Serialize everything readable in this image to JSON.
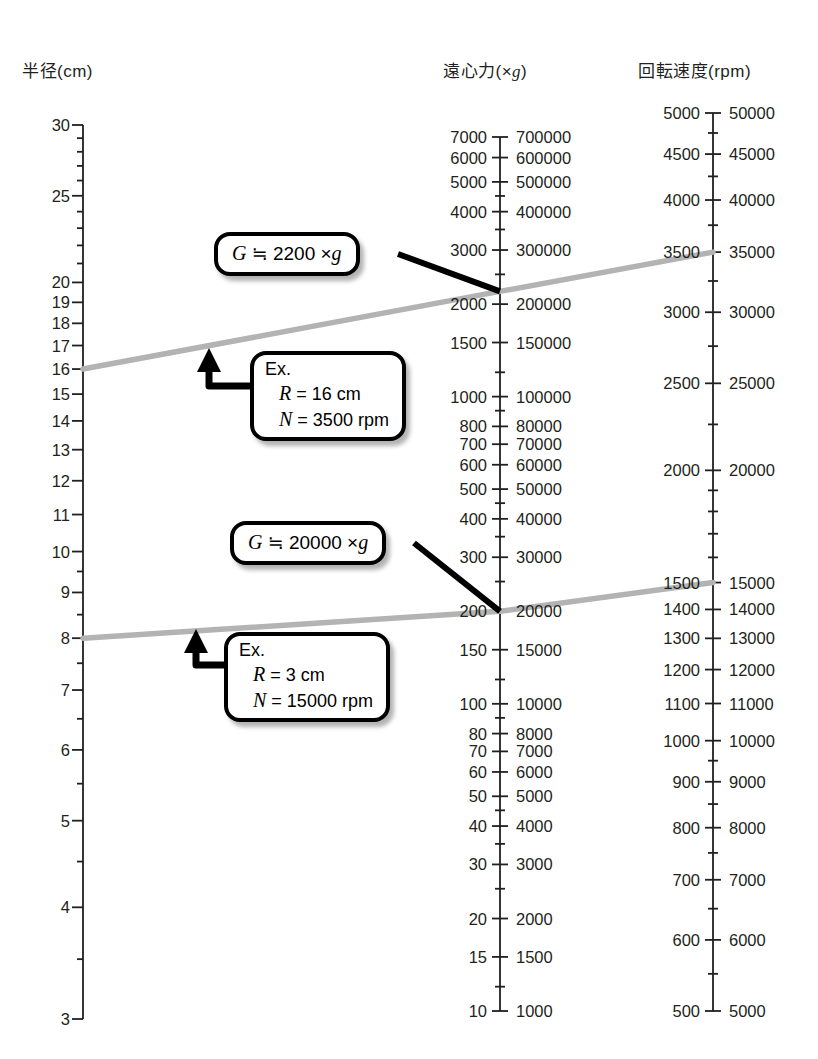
{
  "chart_data": {
    "type": "line",
    "title": "",
    "subtitle": "",
    "axes": [
      {
        "id": "radius",
        "header_main": "半径",
        "header_unit": "(cm)",
        "header_unit_italic": "",
        "scale": "log",
        "range": [
          3,
          30
        ],
        "label_side": "left",
        "ticks": [
          30,
          25,
          20,
          19,
          18,
          17,
          16,
          15,
          14,
          13,
          12,
          11,
          10,
          9,
          8,
          7,
          6,
          5,
          4,
          3
        ],
        "minor_ticks": [
          29,
          28,
          27,
          26,
          24,
          23,
          22,
          21,
          9.5,
          8.5,
          7.5,
          6.5,
          5.5,
          4.5,
          3.5
        ]
      },
      {
        "id": "rcf",
        "header_main": "遠心力",
        "header_unit": "(×g)",
        "header_unit_italic": "g",
        "scale": "log",
        "range": [
          10,
          7000
        ],
        "label_side": "both",
        "ticks_left": [
          7000,
          6000,
          5000,
          4000,
          3000,
          2000,
          1500,
          1000,
          800,
          700,
          600,
          500,
          400,
          300,
          200,
          150,
          100,
          80,
          70,
          60,
          50,
          40,
          30,
          20,
          15,
          10
        ],
        "ticks_right": [
          700000,
          600000,
          500000,
          400000,
          300000,
          200000,
          150000,
          100000,
          80000,
          70000,
          60000,
          50000,
          40000,
          30000,
          20000,
          15000,
          10000,
          8000,
          7000,
          6000,
          5000,
          4000,
          3000,
          2000,
          1500,
          1000
        ],
        "minor_ticks": [
          4500,
          3500,
          2500,
          1200,
          900,
          450,
          350,
          250,
          120,
          90,
          45,
          35,
          25,
          12
        ]
      },
      {
        "id": "rpm",
        "header_main": "回転速度",
        "header_unit": "(rpm)",
        "header_unit_italic": "",
        "scale": "log",
        "range": [
          500,
          5000
        ],
        "label_side": "both",
        "ticks_left": [
          5000,
          4500,
          4000,
          3500,
          3000,
          2500,
          2000,
          1500,
          1400,
          1300,
          1200,
          1100,
          1000,
          900,
          800,
          700,
          600,
          500
        ],
        "ticks_right": [
          50000,
          45000,
          40000,
          35000,
          30000,
          25000,
          20000,
          15000,
          14000,
          13000,
          12000,
          11000,
          10000,
          9000,
          8000,
          7000,
          6000,
          5000
        ],
        "minor_ticks": [
          4750,
          4250,
          3750,
          3250,
          2750,
          2250,
          1900,
          1800,
          1700,
          1600,
          950,
          850,
          750,
          650,
          550
        ]
      }
    ],
    "lines": [
      {
        "name": "example-1",
        "radius_cm": 16,
        "rcf_g": 2200,
        "rpm": 3500,
        "color": "#b3b3b3"
      },
      {
        "name": "example-2",
        "radius_cm": 8,
        "rcf_g": 200,
        "rpm": 1500,
        "color": "#b3b3b3"
      }
    ]
  },
  "headers": {
    "radius": {
      "main": "半径",
      "unit": "(cm)"
    },
    "rcf": {
      "main": "遠心力",
      "open": "(×",
      "ital": "g",
      "close": ")"
    },
    "rpm": {
      "main": "回転速度",
      "unit": "(rpm)"
    }
  },
  "callouts": {
    "g_upper": {
      "var": "G",
      "eq": " ≒ 2200 ×",
      "unit": "g"
    },
    "g_lower": {
      "var": "G",
      "eq": " ≒ 20000 ×",
      "unit": "g"
    },
    "ex_upper": {
      "title": "Ex.",
      "r_var": "R",
      "r_val": " = 16 cm",
      "n_var": "N",
      "n_val": " = 3500 rpm"
    },
    "ex_lower": {
      "title": "Ex.",
      "r_var": "R",
      "r_val": " = 3 cm",
      "n_var": "N",
      "n_val": " = 15000 rpm"
    }
  },
  "colors": {
    "ink": "#231f20",
    "line_gray": "#b3b3b3",
    "callout_border": "#000000",
    "background": "#ffffff"
  }
}
